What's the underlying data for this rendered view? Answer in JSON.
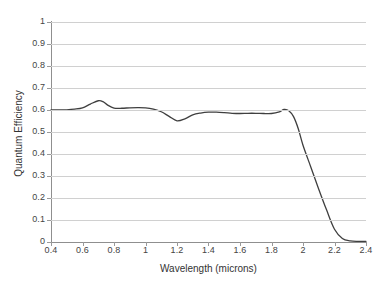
{
  "chart_data": {
    "type": "line",
    "title": "",
    "xlabel": "Wavelength (microns)",
    "ylabel": "Quantum Efficiency",
    "xlim": [
      0.4,
      2.4
    ],
    "ylim": [
      0,
      1
    ],
    "grid": true,
    "legend": false,
    "x_ticks": [
      "0.4",
      "0.6",
      "0.8",
      "1",
      "1.2",
      "1.4",
      "1.6",
      "1.8",
      "2",
      "2.2",
      "2.4"
    ],
    "x_tick_values": [
      0.4,
      0.6,
      0.8,
      1.0,
      1.2,
      1.4,
      1.6,
      1.8,
      2.0,
      2.2,
      2.4
    ],
    "y_ticks": [
      "0",
      "0.1",
      "0.2",
      "0.3",
      "0.4",
      "0.5",
      "0.6",
      "0.7",
      "0.8",
      "0.9",
      "1"
    ],
    "y_tick_values": [
      0,
      0.1,
      0.2,
      0.3,
      0.4,
      0.5,
      0.6,
      0.7,
      0.8,
      0.9,
      1.0
    ],
    "line_color": "#3f3f3f",
    "line_width": 1.3,
    "series": [
      {
        "name": "Quantum Efficiency",
        "x": [
          0.4,
          0.45,
          0.5,
          0.55,
          0.6,
          0.65,
          0.7,
          0.73,
          0.76,
          0.8,
          0.85,
          0.9,
          0.95,
          1.0,
          1.05,
          1.1,
          1.15,
          1.2,
          1.25,
          1.3,
          1.35,
          1.4,
          1.45,
          1.5,
          1.55,
          1.6,
          1.65,
          1.7,
          1.75,
          1.8,
          1.85,
          1.88,
          1.91,
          1.94,
          1.97,
          2.0,
          2.05,
          2.1,
          2.15,
          2.2,
          2.25,
          2.3,
          2.35,
          2.4
        ],
        "y": [
          0.6,
          0.6,
          0.601,
          0.604,
          0.61,
          0.627,
          0.642,
          0.638,
          0.622,
          0.609,
          0.608,
          0.61,
          0.611,
          0.61,
          0.604,
          0.592,
          0.571,
          0.551,
          0.56,
          0.578,
          0.586,
          0.59,
          0.59,
          0.588,
          0.585,
          0.584,
          0.585,
          0.585,
          0.584,
          0.584,
          0.592,
          0.603,
          0.597,
          0.57,
          0.515,
          0.44,
          0.34,
          0.24,
          0.145,
          0.058,
          0.016,
          0.005,
          0.003,
          0.003
        ]
      }
    ]
  }
}
